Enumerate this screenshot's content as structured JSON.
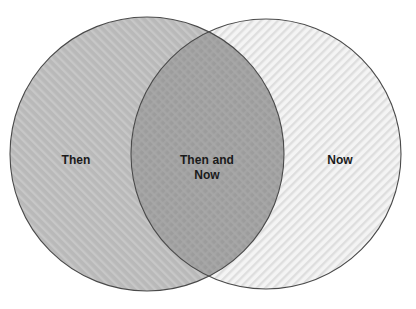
{
  "diagram": {
    "type": "venn",
    "title": "",
    "background_color": "#ffffff",
    "outline_color": "#4a4a4a",
    "sets": [
      {
        "id": "left",
        "label": "Then",
        "region": "left-only",
        "fill_color": "#b9b9b9",
        "hatch": "diagonal-up",
        "hatch_color": "#c9c9c9",
        "center_x": 147,
        "center_y": 154,
        "radius": 137
      },
      {
        "id": "right",
        "label": "Now",
        "region": "right-only",
        "fill_color": "#f2f2f2",
        "hatch": "diagonal-down",
        "hatch_color": "#dcdcdc",
        "center_x": 266,
        "center_y": 154,
        "radius": 135
      }
    ],
    "intersection": {
      "id": "both",
      "label": "Then and\nNow",
      "fill_color": "#9d9d9d",
      "hatch": "crosshatch",
      "hatch_color": "#aaaaaa"
    }
  }
}
